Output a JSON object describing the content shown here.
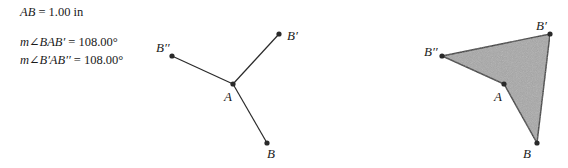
{
  "measurements": [
    {
      "lhs": "AB",
      "value": "1.00 in"
    },
    {
      "lhs": "m∠BAB′",
      "value": "108.00°"
    },
    {
      "lhs": "m∠B′AB′′",
      "value": "108.00°"
    }
  ],
  "left_figure": {
    "points": {
      "A": {
        "label": "A",
        "x": 233,
        "y": 84
      },
      "B": {
        "label": "B",
        "x": 267,
        "y": 143
      },
      "B1": {
        "label": "B′",
        "x": 279,
        "y": 34
      },
      "B2": {
        "label": "B′′",
        "x": 172,
        "y": 56
      }
    }
  },
  "right_figure": {
    "fill": "#a8a8a8",
    "points": {
      "A": {
        "label": "A",
        "x": 504,
        "y": 84
      },
      "B": {
        "label": "B",
        "x": 537,
        "y": 143
      },
      "B1": {
        "label": "B′",
        "x": 550,
        "y": 34
      },
      "B2": {
        "label": "B′′",
        "x": 442,
        "y": 56
      }
    }
  }
}
